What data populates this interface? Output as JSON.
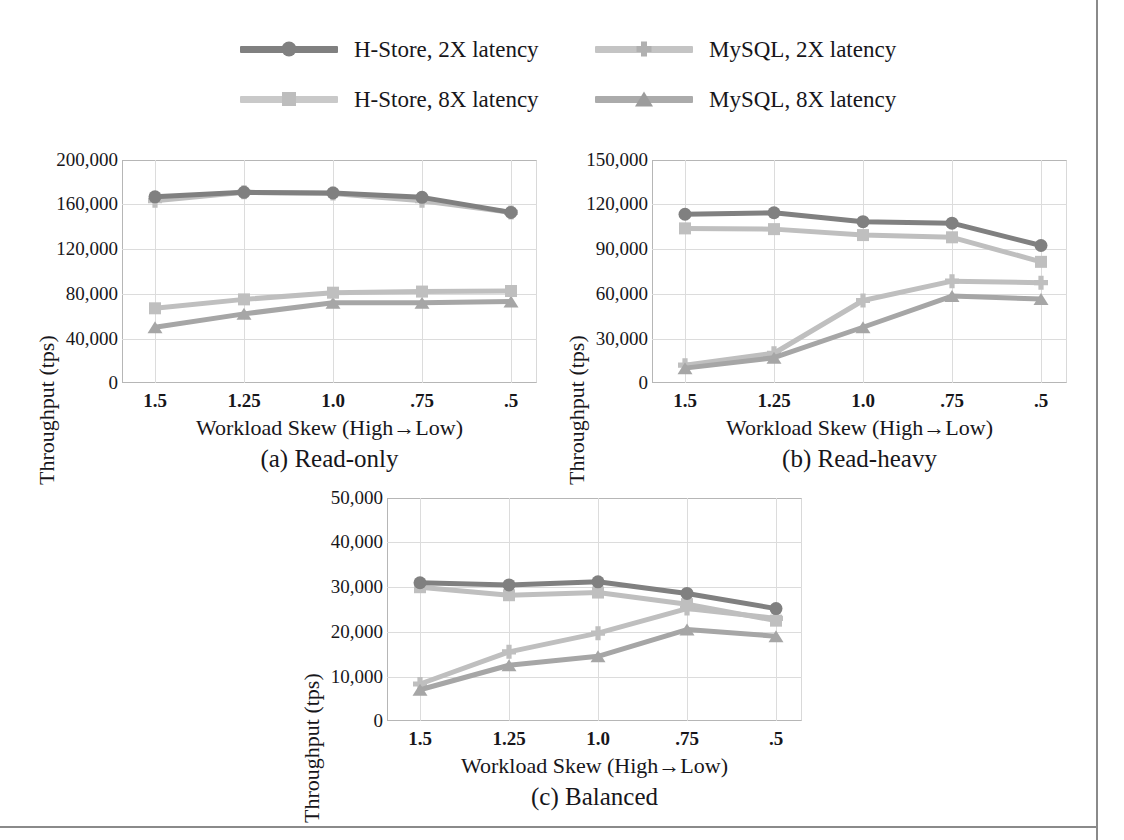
{
  "figure": {
    "y_axis_label": "Throughput (tps)",
    "x_axis_label": "Workload Skew (High→Low)",
    "categories": [
      "1.5",
      "1.25",
      "1.0",
      ".75",
      ".5"
    ]
  },
  "legend": {
    "items": [
      {
        "label": "H-Store, 2X latency",
        "marker": "circle-marker-icon",
        "color": "#808080"
      },
      {
        "label": "MySQL, 2X latency",
        "marker": "plus-marker-icon",
        "color": "#bfbfbf"
      },
      {
        "label": "H-Store, 8X latency",
        "marker": "square-marker-icon",
        "color": "#bfbfbf"
      },
      {
        "label": "MySQL, 8X latency",
        "marker": "triangle-marker-icon",
        "color": "#a6a6a6"
      }
    ]
  },
  "charts": [
    {
      "id": "read-only",
      "caption": "(a) Read-only",
      "yticks": [
        "200,000",
        "160,000",
        "120,000",
        "80,000",
        "40,000",
        "0"
      ]
    },
    {
      "id": "read-heavy",
      "caption": "(b) Read-heavy",
      "yticks": [
        "150,000",
        "120,000",
        "90,000",
        "60,000",
        "30,000",
        "0"
      ]
    },
    {
      "id": "balanced",
      "caption": "(c) Balanced",
      "yticks": [
        "50,000",
        "40,000",
        "30,000",
        "20,000",
        "10,000",
        "0"
      ]
    }
  ],
  "chart_data": [
    {
      "type": "line",
      "title": "(a) Read-only",
      "xlabel": "Workload Skew (High→Low)",
      "ylabel": "Throughput (tps)",
      "categories": [
        "1.5",
        "1.25",
        "1.0",
        ".75",
        ".5"
      ],
      "ylim": [
        0,
        200000
      ],
      "yticks": [
        0,
        40000,
        80000,
        120000,
        160000,
        200000
      ],
      "grid": true,
      "legend_position": "top",
      "series": [
        {
          "name": "H-Store, 2X latency",
          "color": "#808080",
          "marker": "circle",
          "values": [
            167000,
            171000,
            170500,
            166500,
            153000
          ]
        },
        {
          "name": "H-Store, 8X latency",
          "color": "#bfbfbf",
          "marker": "square",
          "values": [
            67000,
            75000,
            81000,
            82000,
            82500
          ]
        },
        {
          "name": "MySQL, 2X latency",
          "color": "#bfbfbf",
          "marker": "plus",
          "values": [
            163500,
            171000,
            170000,
            163500,
            153000
          ]
        },
        {
          "name": "MySQL, 8X latency",
          "color": "#a6a6a6",
          "marker": "triangle",
          "values": [
            50000,
            62000,
            72000,
            72000,
            73000
          ]
        }
      ]
    },
    {
      "type": "line",
      "title": "(b) Read-heavy",
      "xlabel": "Workload Skew (High→Low)",
      "ylabel": "Throughput (tps)",
      "categories": [
        "1.5",
        "1.25",
        "1.0",
        ".75",
        ".5"
      ],
      "ylim": [
        0,
        150000
      ],
      "yticks": [
        0,
        30000,
        60000,
        90000,
        120000,
        150000
      ],
      "grid": true,
      "legend_position": "top",
      "series": [
        {
          "name": "H-Store, 2X latency",
          "color": "#808080",
          "marker": "circle",
          "values": [
            113500,
            114500,
            108500,
            107500,
            92500
          ]
        },
        {
          "name": "H-Store, 8X latency",
          "color": "#bfbfbf",
          "marker": "square",
          "values": [
            104000,
            103500,
            99500,
            98000,
            81500
          ]
        },
        {
          "name": "MySQL, 2X latency",
          "color": "#bfbfbf",
          "marker": "plus",
          "values": [
            12000,
            20000,
            55500,
            68500,
            67500
          ]
        },
        {
          "name": "MySQL, 8X latency",
          "color": "#a6a6a6",
          "marker": "triangle",
          "values": [
            10000,
            17000,
            37500,
            58500,
            56500
          ]
        }
      ]
    },
    {
      "type": "line",
      "title": "(c) Balanced",
      "xlabel": "Workload Skew (High→Low)",
      "ylabel": "Throughput (tps)",
      "categories": [
        "1.5",
        "1.25",
        "1.0",
        ".75",
        ".5"
      ],
      "ylim": [
        0,
        50000
      ],
      "yticks": [
        0,
        10000,
        20000,
        30000,
        40000,
        50000
      ],
      "grid": true,
      "legend_position": "top",
      "series": [
        {
          "name": "H-Store, 2X latency",
          "color": "#808080",
          "marker": "circle",
          "values": [
            31000,
            30500,
            31200,
            28600,
            25200
          ]
        },
        {
          "name": "H-Store, 8X latency",
          "color": "#bfbfbf",
          "marker": "square",
          "values": [
            30000,
            28200,
            28800,
            26200,
            22500
          ]
        },
        {
          "name": "MySQL, 2X latency",
          "color": "#bfbfbf",
          "marker": "plus",
          "values": [
            8300,
            15500,
            19700,
            25200,
            23000
          ]
        },
        {
          "name": "MySQL, 8X latency",
          "color": "#a6a6a6",
          "marker": "triangle",
          "values": [
            7000,
            12500,
            14500,
            20500,
            19000
          ]
        }
      ]
    }
  ]
}
